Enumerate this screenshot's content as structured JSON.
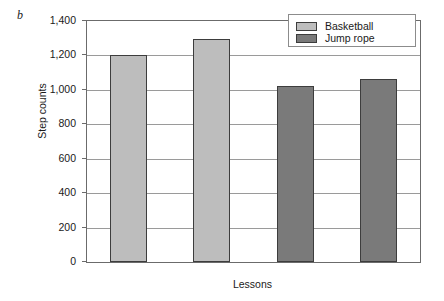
{
  "figure": {
    "panel_letter": "b"
  },
  "chart_data": {
    "type": "bar",
    "title": "",
    "xlabel": "Lessons",
    "ylabel": "Step counts",
    "categories": [
      "1",
      "2",
      "3",
      "4"
    ],
    "values": [
      1200,
      1295,
      1020,
      1065
    ],
    "bar_groups": [
      {
        "category": "1",
        "value": 1200,
        "series": "Basketball"
      },
      {
        "category": "2",
        "value": 1295,
        "series": "Basketball"
      },
      {
        "category": "3",
        "value": 1020,
        "series": "Jump rope"
      },
      {
        "category": "4",
        "value": 1065,
        "series": "Jump rope"
      }
    ],
    "series": [
      {
        "name": "Basketball",
        "color": "#bdbdbd",
        "values": [
          1200,
          1295,
          null,
          null
        ]
      },
      {
        "name": "Jump rope",
        "color": "#7a7a7a",
        "values": [
          null,
          null,
          1020,
          1065
        ]
      }
    ],
    "ylim": [
      0,
      1400
    ],
    "ytick_values": [
      0,
      200,
      400,
      600,
      800,
      1000,
      1200,
      1400
    ],
    "ytick_labels": [
      "0",
      "200",
      "400",
      "600",
      "800",
      "1,000",
      "1,200",
      "1,400"
    ],
    "xtick_labels": [
      "",
      "",
      "",
      ""
    ],
    "grid": "horizontal",
    "legend_position": "top-right",
    "frame": true
  },
  "legend": {
    "entries": [
      {
        "label": "Basketball",
        "color": "#bdbdbd"
      },
      {
        "label": "Jump rope",
        "color": "#7a7a7a"
      }
    ]
  },
  "colors": {
    "basketball": "#bdbdbd",
    "jump_rope": "#7a7a7a",
    "bar_outline": "#3d3d3d",
    "gridline": "#9a9a9a",
    "frame": "#6b6b6b",
    "text": "#1a1a1a",
    "background": "#ffffff"
  }
}
